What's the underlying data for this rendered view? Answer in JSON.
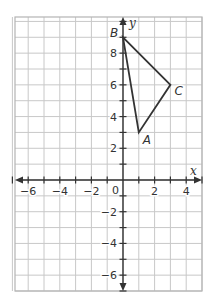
{
  "chart_data": {
    "type": "scatter",
    "title": "",
    "xlabel": "x",
    "ylabel": "y",
    "xlim": [
      -7,
      5
    ],
    "ylim": [
      -7,
      10.3
    ],
    "grid": true,
    "x_ticks": [
      -6,
      -4,
      -2,
      2,
      4
    ],
    "y_ticks": [
      -6,
      -4,
      -2,
      2,
      4,
      6,
      8
    ],
    "x_tick_labels": [
      "−6",
      "−4",
      "−2",
      "2",
      "4"
    ],
    "y_tick_labels": [
      "−6",
      "−4",
      "−2",
      "2",
      "4",
      "6",
      "8"
    ],
    "origin_label": "0",
    "polygon": {
      "name": "triangle ABC",
      "vertices": [
        {
          "label": "A",
          "x": 1,
          "y": 3
        },
        {
          "label": "B",
          "x": 0,
          "y": 9
        },
        {
          "label": "C",
          "x": 3,
          "y": 6
        }
      ]
    }
  },
  "colors": {
    "grid": "#c8c8c8",
    "border": "#b4b4b4",
    "axis": "#333333",
    "triangle": "#333333",
    "background": "#ffffff"
  }
}
